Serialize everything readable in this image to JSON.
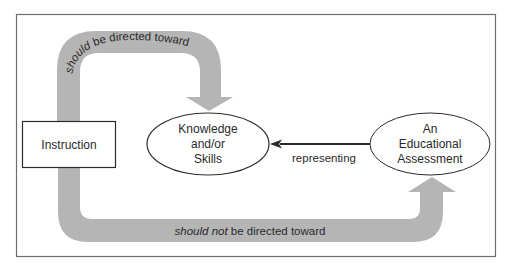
{
  "colors": {
    "band": "#b5b5b5",
    "stroke": "#2b2b2b",
    "frame": "#6e6e6e",
    "text": "#2a2a2a"
  },
  "nodes": {
    "instruction": {
      "label": "Instruction"
    },
    "knowledge": {
      "lines": [
        "Knowledge",
        "and/or",
        "Skills"
      ]
    },
    "assessment": {
      "lines": [
        "An",
        "Educational",
        "Assessment"
      ]
    }
  },
  "edges": {
    "top_arc": {
      "italic": "should",
      "rest": " be directed toward"
    },
    "bottom_arc": {
      "italic": "should not",
      "rest": " be directed toward"
    },
    "represent": {
      "label": "representing"
    }
  }
}
